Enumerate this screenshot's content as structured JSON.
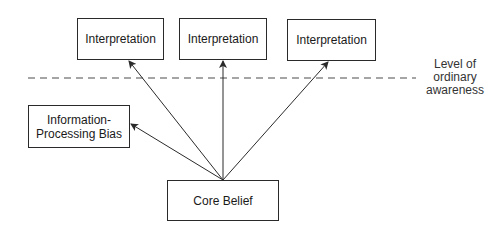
{
  "diagram": {
    "interpretations": [
      {
        "label": "Interpretation"
      },
      {
        "label": "Interpretation"
      },
      {
        "label": "Interpretation"
      }
    ],
    "bias_box": {
      "line1": "Information-",
      "line2": "Processing Bias"
    },
    "core_box": {
      "label": "Core Belief"
    },
    "awareness_label": {
      "line1": "Level of",
      "line2": "ordinary",
      "line3": "awareness"
    },
    "colors": {
      "line": "#2a2a2a",
      "dashed": "#888888"
    }
  }
}
